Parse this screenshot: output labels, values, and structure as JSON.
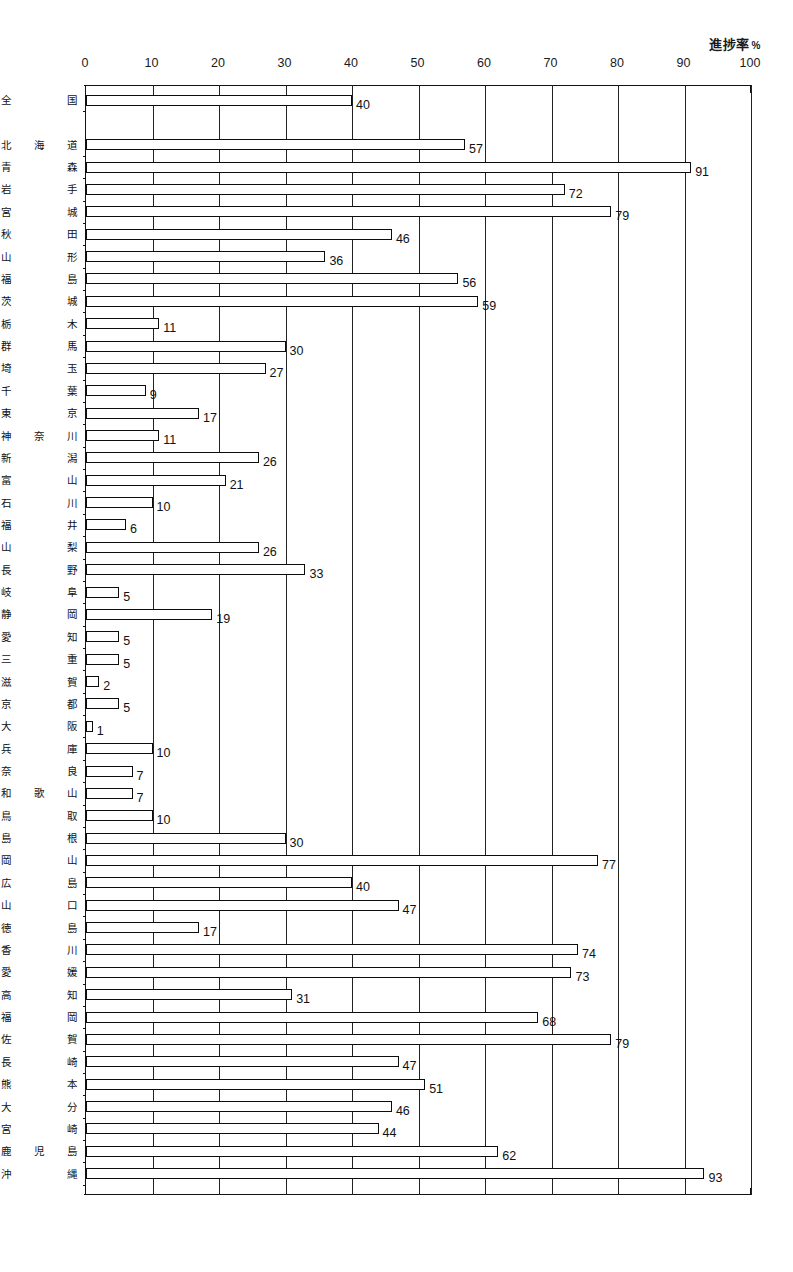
{
  "chart_data": {
    "type": "bar",
    "orientation": "horizontal",
    "title": "進捗率",
    "unit": "%",
    "xlabel": "",
    "ylabel": "",
    "xlim": [
      0,
      100
    ],
    "xticks": [
      0,
      10,
      20,
      30,
      40,
      50,
      60,
      70,
      80,
      90,
      100
    ],
    "xtick_labels": [
      "0",
      "10",
      "20",
      "30",
      "40",
      "50",
      "60",
      "70",
      "80",
      "90",
      "100"
    ],
    "grid": true,
    "grid_axis": "x",
    "legend": false,
    "bar_style": {
      "fill": "#ffffff",
      "edge": "#0d0d0d",
      "value_labels": true
    },
    "categories": [
      "全 国",
      "北海道",
      "青 森",
      "岩 手",
      "宮 城",
      "秋 田",
      "山 形",
      "福 島",
      "茨 城",
      "栃 木",
      "群 馬",
      "埼 玉",
      "千 葉",
      "東 京",
      "神奈川",
      "新 潟",
      "富 山",
      "石 川",
      "福 井",
      "山 梨",
      "長 野",
      "岐 阜",
      "静 岡",
      "愛 知",
      "三 重",
      "滋 賀",
      "京 都",
      "大 阪",
      "兵 庫",
      "奈 良",
      "和歌山",
      "鳥 取",
      "島 根",
      "岡 山",
      "広 島",
      "山 口",
      "徳 島",
      "香 川",
      "愛 媛",
      "高 知",
      "福 岡",
      "佐 賀",
      "長 崎",
      "熊 本",
      "大 分",
      "宮 崎",
      "鹿児島",
      "沖 縄"
    ],
    "values": [
      40,
      57,
      91,
      72,
      79,
      46,
      36,
      56,
      59,
      11,
      30,
      27,
      9,
      17,
      11,
      26,
      21,
      10,
      6,
      26,
      33,
      5,
      19,
      5,
      5,
      2,
      5,
      1,
      10,
      7,
      7,
      10,
      30,
      77,
      40,
      47,
      17,
      74,
      73,
      31,
      68,
      79,
      47,
      51,
      46,
      44,
      62,
      93
    ],
    "value_labels": [
      "40",
      "57",
      "91",
      "72",
      "79",
      "46",
      "36",
      "56",
      "59",
      "11",
      "30",
      "27",
      "9",
      "17",
      "11",
      "26",
      "21",
      "10",
      "6",
      "26",
      "33",
      "5",
      "19",
      "5",
      "5",
      "2",
      "5",
      "1",
      "10",
      "7",
      "7",
      "10",
      "30",
      "77",
      "40",
      "47",
      "17",
      "74",
      "73",
      "31",
      "68",
      "79",
      "47",
      "51",
      "46",
      "44",
      "62",
      "93"
    ]
  },
  "caption": {
    "text": ""
  },
  "colors": {
    "ink": "#111111",
    "bar_fill": "#ffffff",
    "bar_edge": "#0d0d0d",
    "grid": "#222222",
    "background": "#ffffff"
  }
}
